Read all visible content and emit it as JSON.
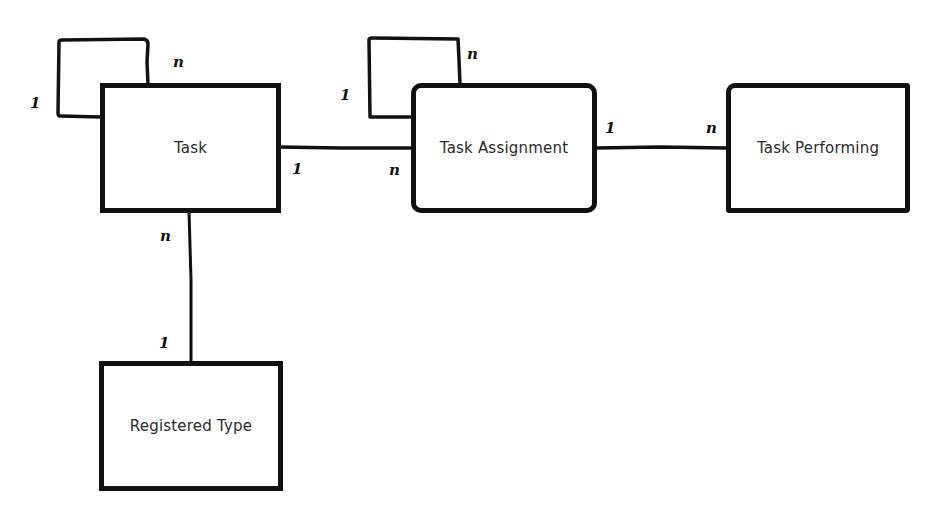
{
  "diagram": {
    "type": "entity-relationship",
    "entities": [
      {
        "id": "task",
        "label": "Task"
      },
      {
        "id": "task_assignment",
        "label": "Task Assignment"
      },
      {
        "id": "task_performing",
        "label": "Task Performing"
      },
      {
        "id": "registered_type",
        "label": "Registered Type"
      }
    ],
    "relationships": [
      {
        "from": "task",
        "to": "task",
        "from_card": "1",
        "to_card": "n",
        "kind": "self"
      },
      {
        "from": "task_assignment",
        "to": "task_assignment",
        "from_card": "1",
        "to_card": "n",
        "kind": "self"
      },
      {
        "from": "task",
        "to": "task_assignment",
        "from_card": "1",
        "to_card": "n"
      },
      {
        "from": "task_assignment",
        "to": "task_performing",
        "from_card": "1",
        "to_card": "n"
      },
      {
        "from": "registered_type",
        "to": "task",
        "from_card": "1",
        "to_card": "n"
      }
    ],
    "labels": {
      "task_self_one": "1",
      "task_self_many": "n",
      "ta_self_one": "1",
      "ta_self_many": "n",
      "task_to_ta_one": "1",
      "task_to_ta_many": "n",
      "ta_to_tp_one": "1",
      "ta_to_tp_many": "n",
      "rt_to_task_many": "n",
      "rt_to_task_one": "1"
    }
  }
}
